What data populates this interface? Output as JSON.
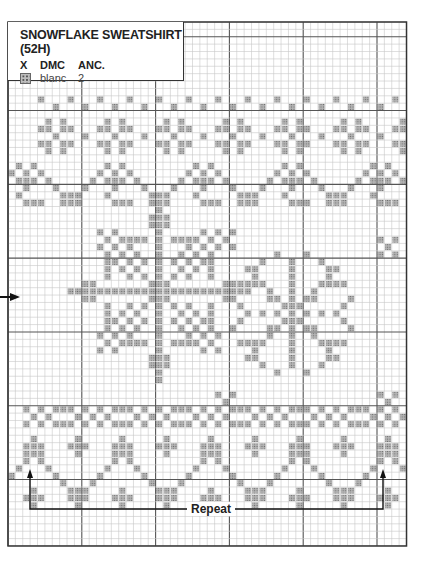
{
  "legend": {
    "title": "SNOWFLAKE SWEATSHIRT (52H)",
    "columns": [
      "X",
      "DMC",
      "ANC."
    ],
    "rows": [
      {
        "symbol": "dotted-square",
        "dmc": "blanc",
        "anc": "2"
      }
    ]
  },
  "repeat_label": "Repeat",
  "grid": {
    "left": 8,
    "top": 22,
    "cell": 7.38,
    "cols": 54,
    "rows": 71,
    "bold_every": 10,
    "bold_col_offset": 0,
    "bold_row_offset": 2,
    "colors": {
      "thin": "#c8c8c8",
      "bold": "#555555",
      "border": "#333333",
      "stitch": "#b4b4b4",
      "stitch_dot": "#6a6a6a"
    }
  },
  "motifs": {
    "top_dots_a": {
      "row": 10,
      "start": 4,
      "step": 4,
      "cols": 1
    },
    "top_dots_b": {
      "row": 11,
      "start": 6,
      "step": 4,
      "cols": 1
    },
    "small_star": {
      "rows_start": 13,
      "period": 8,
      "start": 6,
      "cells": [
        [
          -1,
          0
        ],
        [
          1,
          0
        ],
        [
          -2,
          1
        ],
        [
          -1,
          1
        ],
        [
          1,
          1
        ],
        [
          2,
          1
        ],
        [
          0,
          2
        ],
        [
          -2,
          3
        ],
        [
          -1,
          3
        ],
        [
          1,
          3
        ],
        [
          2,
          3
        ],
        [
          -1,
          4
        ],
        [
          1,
          4
        ]
      ],
      "between": [
        [
          4,
          2
        ]
      ]
    },
    "wave_top": {
      "rows_start": 19,
      "period": 12,
      "start": 3,
      "cells": [
        [
          0,
          0
        ],
        [
          1,
          1
        ],
        [
          2,
          2
        ],
        [
          3,
          3
        ],
        [
          4,
          4
        ],
        [
          5,
          4
        ],
        [
          6,
          4
        ],
        [
          7,
          3
        ],
        [
          8,
          2
        ],
        [
          9,
          1
        ],
        [
          10,
          0
        ],
        [
          4,
          1
        ],
        [
          5,
          0
        ],
        [
          6,
          1
        ],
        [
          5,
          2
        ],
        [
          5,
          3
        ]
      ]
    },
    "big_flake": {
      "center_col": 20,
      "center_row": 36
    },
    "small_flake": {
      "center_col": 38,
      "center_row": 39
    },
    "tiny_x": [
      {
        "col": 28,
        "row": 28
      },
      {
        "col": 50,
        "row": 29
      },
      {
        "col": 28,
        "row": 50
      },
      {
        "col": 50,
        "row": 50
      }
    ],
    "band_bottom": {
      "row": 52,
      "period": 8,
      "start": 2
    },
    "wave_bottom": {
      "rows_start": 56,
      "period": 12,
      "start": 3
    }
  }
}
